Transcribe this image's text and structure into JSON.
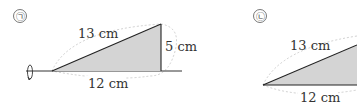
{
  "figures": [
    {
      "marker": "㉠",
      "hypotenuse": "13 cm",
      "height": "5 cm",
      "base": "12 cm"
    },
    {
      "marker": "㉡",
      "hypotenuse": "13 cm",
      "base": "12 cm"
    }
  ],
  "colors": {
    "fill": "#d4d4d4",
    "stroke": "#222222",
    "dashed": "#bbbbbb"
  }
}
